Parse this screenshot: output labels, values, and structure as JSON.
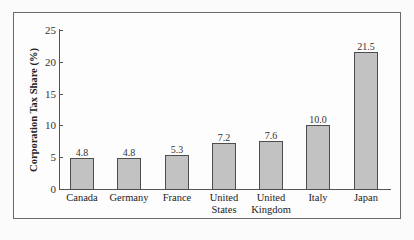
{
  "chart_data": {
    "type": "bar",
    "title": "",
    "xlabel": "",
    "ylabel": "Corporation Tax Share (%)",
    "ylim": [
      0,
      25
    ],
    "yticks": [
      0,
      5,
      10,
      15,
      20,
      25
    ],
    "grid": false,
    "legend": null,
    "categories": [
      "Canada",
      "Germany",
      "France",
      "United States",
      "United Kingdom",
      "Italy",
      "Japan"
    ],
    "category_lines": [
      [
        "Canada"
      ],
      [
        "Germany"
      ],
      [
        "France"
      ],
      [
        "United",
        "States"
      ],
      [
        "United",
        "Kingdom"
      ],
      [
        "Italy"
      ],
      [
        "Japan"
      ]
    ],
    "values": [
      4.8,
      4.8,
      5.3,
      7.2,
      7.6,
      10.0,
      21.5
    ],
    "value_labels": [
      "4.8",
      "4.8",
      "5.3",
      "7.2",
      "7.6",
      "10.0",
      "21.5"
    ],
    "colors": {
      "bar_fill": "#c2c2c2",
      "bar_border": "#4d4d4d"
    }
  }
}
